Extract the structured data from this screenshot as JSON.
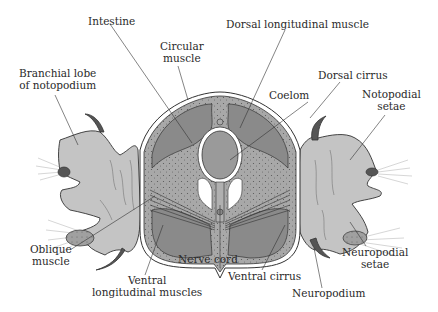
{
  "figure": {
    "colors": {
      "background": "#ffffff",
      "body_fill": "#b4b4b4",
      "muscle_fill": "#8a8a8a",
      "coelom_fill": "#9a9a9a",
      "parapodium_fill": "#c4c4c4",
      "cuticle": "#ffffff",
      "line": "#333333",
      "text": "#2a2a2a"
    }
  },
  "labels": {
    "intestine": [
      "Intestine"
    ],
    "circular_muscle": [
      "Circular",
      "muscle"
    ],
    "branchial_lobe": [
      "Branchial lobe",
      "of notopodium"
    ],
    "dorsal_longitudinal_muscle": [
      "Dorsal longitudinal muscle"
    ],
    "dorsal_cirrus": [
      "Dorsal cirrus"
    ],
    "coelom": [
      "Coelom"
    ],
    "notopodial_setae": [
      "Notopodial",
      "setae"
    ],
    "oblique_muscle": [
      "Oblique",
      "muscle"
    ],
    "ventral_longitudinal_muscles": [
      "Ventral",
      "longitudinal muscles"
    ],
    "nerve_cord": [
      "Nerve cord"
    ],
    "ventral_cirrus": [
      "Ventral cirrus"
    ],
    "neuropodium": [
      "Neuropodium"
    ],
    "neuropodial_setae": [
      "Neuropodial",
      "setae"
    ]
  }
}
